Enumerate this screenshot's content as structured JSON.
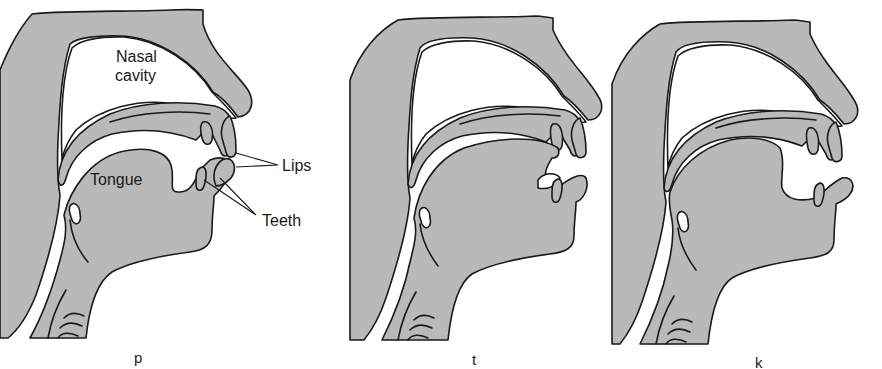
{
  "figure": {
    "colors": {
      "tissue": "#b9b9b9",
      "outline": "#1a1a1a",
      "background": "#ffffff"
    },
    "panels": [
      {
        "id": "p",
        "caption": "p",
        "articulation": "bilabial closure",
        "labels": {
          "nasal_cavity_line1": "Nasal",
          "nasal_cavity_line2": "cavity",
          "tongue": "Tongue",
          "lips": "Lips",
          "teeth": "Teeth"
        }
      },
      {
        "id": "t",
        "caption": "t",
        "articulation": "tongue tip at alveolar ridge"
      },
      {
        "id": "k",
        "caption": "k",
        "articulation": "tongue back at velum"
      }
    ]
  }
}
